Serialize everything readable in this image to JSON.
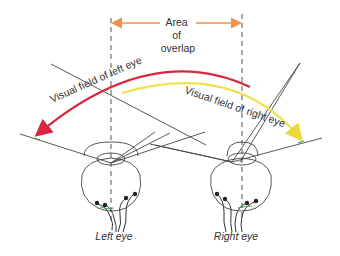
{
  "diagram": {
    "overlap_label": [
      "Area",
      "of",
      "overlap"
    ],
    "left_field_label": "Visual field of left eye",
    "right_field_label": "Visual field of right eye",
    "left_eye_label": "Left eye",
    "right_eye_label": "Right eye",
    "colors": {
      "left_field_arrow": "#d8263e",
      "right_field_arrow": "#f2e14a",
      "overlap_arrow": "#f0904a",
      "lines": "#444444",
      "text": "#333333",
      "nerve_accent": "#3a9a4a"
    }
  }
}
